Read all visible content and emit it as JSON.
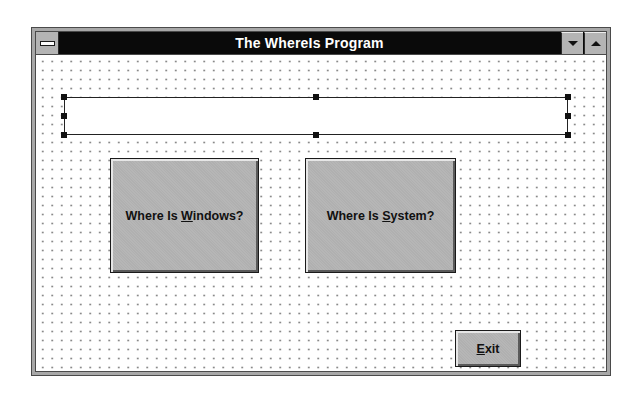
{
  "window": {
    "title": "The WhereIs Program",
    "controls": {
      "system_menu_icon": "system-menu-bar-icon",
      "minimize_icon": "triangle-down",
      "maximize_icon": "triangle-up"
    }
  },
  "form": {
    "textbox": {
      "value": "",
      "selected": true
    },
    "buttons": {
      "windows": {
        "prefix": "Where Is ",
        "accel": "W",
        "suffix": "indows?"
      },
      "system": {
        "prefix": "Where Is ",
        "accel": "S",
        "suffix": "ystem?"
      },
      "exit": {
        "prefix": "",
        "accel": "E",
        "suffix": "xit"
      }
    }
  },
  "colors": {
    "titlebar_bg": "#0a0a0a",
    "titlebar_text": "#ffffff",
    "button_face": "#b0b0b0",
    "grid_dot": "#8a8a8a"
  }
}
